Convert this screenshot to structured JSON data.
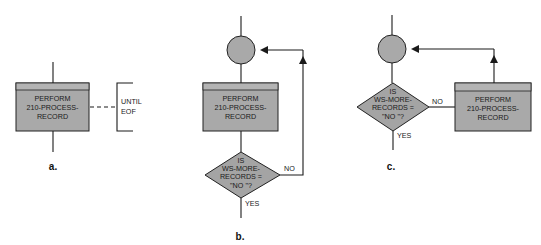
{
  "colors": {
    "shape_fill": "#a9a9a9",
    "header_fill": "#b4b4b4",
    "stroke": "#222222",
    "background": "#ffffff"
  },
  "diagram_a": {
    "caption": "a.",
    "process_box": {
      "lines": [
        "PERFORM",
        "210-PROCESS-",
        "RECORD"
      ]
    },
    "annotation": {
      "lines": [
        "UNTIL",
        "EOF"
      ]
    }
  },
  "diagram_b": {
    "caption": "b.",
    "process_box": {
      "lines": [
        "PERFORM",
        "210-PROCESS-",
        "RECORD"
      ]
    },
    "decision": {
      "lines": [
        "IS",
        "WS-MORE-",
        "RECORDS =",
        "\"NO \"?"
      ]
    },
    "no_label": "NO",
    "yes_label": "YES"
  },
  "diagram_c": {
    "caption": "c.",
    "process_box": {
      "lines": [
        "PERFORM",
        "210-PROCESS-",
        "RECORD"
      ]
    },
    "decision": {
      "lines": [
        "IS",
        "WS-MORE-",
        "RECORDS =",
        "\"NO \"?"
      ]
    },
    "no_label": "NO",
    "yes_label": "YES"
  }
}
